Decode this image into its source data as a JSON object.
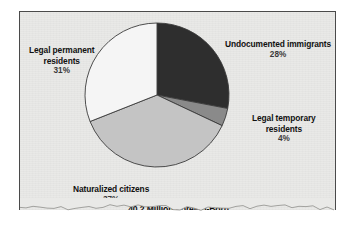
{
  "figure": {
    "title": "40.2 Million Foreign-Born",
    "background_color": "#e9e9e7",
    "border_color": "#4a4a4a"
  },
  "chart_data": {
    "type": "pie",
    "title": "40.2 Million Foreign-Born",
    "subtitle": "",
    "xlabel": "",
    "ylabel": "",
    "total_label": "40.2 Million Foreign-Born",
    "legend_position": "none",
    "grid": false,
    "start_angle_deg": 0,
    "direction": "clockwise",
    "categories": [
      "Undocumented immigrants",
      "Legal temporary residents",
      "Naturalized citizens",
      "Legal permanent residents"
    ],
    "values": [
      28,
      4,
      37,
      31
    ],
    "value_labels": [
      "28%",
      "4%",
      "37%",
      "31%"
    ],
    "units": "percent",
    "colors": [
      "#2e2e2e",
      "#8a8a8a",
      "#c4c4c4",
      "#f5f5f5"
    ],
    "slices": [
      {
        "label": "Undocumented immigrants",
        "label_line1": "Undocumented immigrants",
        "label_line2": "",
        "value": 28,
        "value_label": "28%",
        "color": "#2e2e2e",
        "start_deg": 0,
        "end_deg": 100.8
      },
      {
        "label": "Legal temporary residents",
        "label_line1": "Legal temporary",
        "label_line2": "residents",
        "value": 4,
        "value_label": "4%",
        "color": "#8a8a8a",
        "start_deg": 100.8,
        "end_deg": 115.2
      },
      {
        "label": "Naturalized citizens",
        "label_line1": "Naturalized citizens",
        "label_line2": "",
        "value": 37,
        "value_label": "37%",
        "color": "#c4c4c4",
        "start_deg": 115.2,
        "end_deg": 248.4
      },
      {
        "label": "Legal permanent residents",
        "label_line1": "Legal permanent",
        "label_line2": "residents",
        "value": 31,
        "value_label": "31%",
        "color": "#f5f5f5",
        "start_deg": 248.4,
        "end_deg": 360
      }
    ]
  },
  "labels": {
    "undocumented": {
      "line1": "Undocumented immigrants",
      "line2": "",
      "pct": "28%"
    },
    "permanent": {
      "line1": "Legal permanent",
      "line2": "residents",
      "pct": "31%"
    },
    "temporary": {
      "line1": "Legal temporary",
      "line2": "residents",
      "pct": "4%"
    },
    "naturalized": {
      "line1": "Naturalized citizens",
      "line2": "",
      "pct": "37%"
    }
  }
}
